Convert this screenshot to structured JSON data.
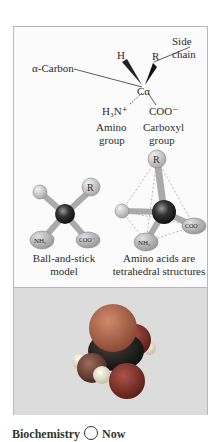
{
  "structure": {
    "alpha_carbon_label": "α-Carbon",
    "h_label": "H",
    "r_label": "R",
    "center_label": "Cα",
    "side_chain_label_line1": "Side",
    "side_chain_label_line2": "chain",
    "amino_formula": "H₃N⁺",
    "carboxyl_formula": "COO⁻",
    "amino_group_line1": "Amino",
    "amino_group_line2": "group",
    "carboxyl_group_line1": "Carboxyl",
    "carboxyl_group_line2": "group"
  },
  "ball_stick": {
    "r_label": "R",
    "nh3_label": "NH₃",
    "coo_label": "COO⁻",
    "caption_line1": "Ball-and-stick",
    "caption_line2": "model"
  },
  "tetrahedral": {
    "r_label": "R",
    "h_label": "H",
    "nh3_label": "NH₃",
    "coo_label": "COO⁻",
    "caption_line1": "Amino acids are",
    "caption_line2": "tetrahedral structures"
  },
  "space_filling": {
    "colors": {
      "side_chain": "#b86a4e",
      "carbon": "#2a2420",
      "oxygen": "#8a3a30",
      "nitrogen": "#7a4a40",
      "hydrogen": "#f0ead8"
    }
  },
  "footer": {
    "text_before": "Biochemistry",
    "text_after": "Now"
  }
}
